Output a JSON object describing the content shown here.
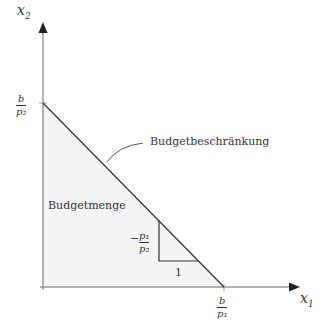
{
  "axes": {
    "x_label": "x",
    "x_sub": "1",
    "y_label": "x",
    "y_sub": "2"
  },
  "intercepts": {
    "y_intercept": {
      "num": "b",
      "den": "p₂"
    },
    "x_intercept": {
      "num": "b",
      "den": "p₁"
    }
  },
  "labels": {
    "budget_line": "Budgetbeschränkung",
    "budget_set": "Budgetmenge",
    "slope_run": "1",
    "slope_rise_sign": "−",
    "slope_rise": {
      "num": "p₁",
      "den": "p₂"
    }
  },
  "colors": {
    "axis": "#999999",
    "line": "#333333",
    "fill": "#f4f4f4"
  }
}
